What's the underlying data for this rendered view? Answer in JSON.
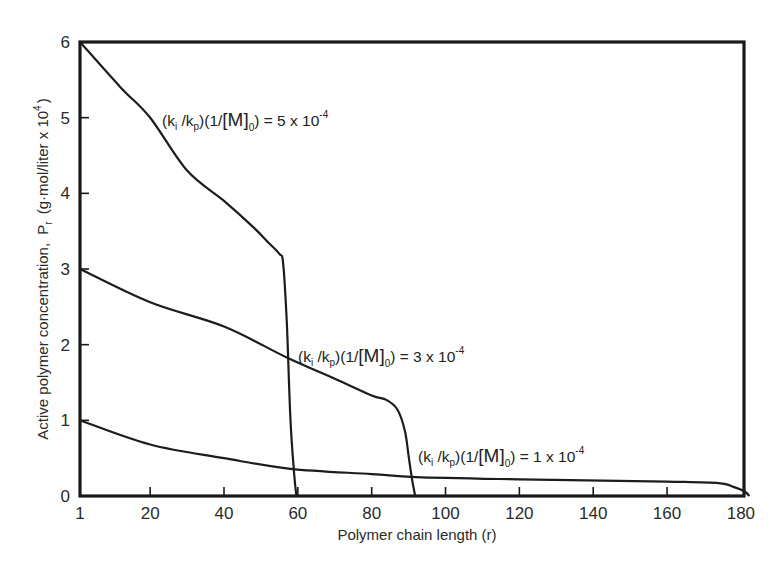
{
  "chart_data": {
    "type": "line",
    "title": "",
    "xlabel": "Polymer chain length (r)",
    "ylabel": "Active polymer concentration, Pr (g·mol/liter x 10^4)",
    "ylabel_parts": {
      "prefix": "Active polymer concentration,",
      "symbol": "P",
      "symbol_sub": "r",
      "units": "(g·mol/liter x 10",
      "units_sup": "4",
      "units_close": ")"
    },
    "xlim": [
      1,
      183
    ],
    "ylim": [
      0,
      6
    ],
    "x_ticks": [
      1,
      20,
      40,
      60,
      80,
      100,
      120,
      140,
      160,
      180
    ],
    "x_tick_labels": [
      "1",
      "20",
      "40",
      "60",
      "80",
      "100",
      "120",
      "140",
      "160",
      "180"
    ],
    "y_ticks": [
      0,
      1,
      2,
      3,
      4,
      5,
      6
    ],
    "y_tick_labels": [
      "0",
      "1",
      "2",
      "3",
      "4",
      "5",
      "6"
    ],
    "grid": false,
    "legend": "none (curves labeled inline)",
    "series": [
      {
        "name": "(ki/kp)(1/[M]0) = 5 x 10^-4",
        "label": {
          "pre": "(k",
          "sub1": "i",
          "mid1": " /k",
          "sub2": "p",
          "mid2": ")(1/",
          "bracket": "[M]",
          "sub3": "0",
          "mid3": ") = 5 x 10",
          "sup": "-4"
        },
        "label_pos": {
          "x": 162,
          "y": 126
        },
        "x": [
          1,
          12,
          20,
          30,
          40,
          48,
          52,
          55,
          56,
          57,
          58,
          59,
          59.6
        ],
        "y": [
          6.0,
          5.4,
          5.0,
          4.3,
          3.9,
          3.55,
          3.35,
          3.2,
          3.08,
          2.3,
          1.0,
          0.3,
          0.0
        ]
      },
      {
        "name": "(ki/kp)(1/[M]0) = 3 x 10^-4",
        "label": {
          "pre": "(k",
          "sub1": "i",
          "mid1": " /k",
          "sub2": "p",
          "mid2": ")(1/",
          "bracket": "[M]",
          "sub3": "0",
          "mid3": ") = 3 x 10",
          "sup": "-4"
        },
        "label_pos": {
          "x": 298,
          "y": 362
        },
        "x": [
          1,
          20,
          40,
          57,
          70,
          80,
          84,
          87,
          89,
          90,
          91,
          91.8
        ],
        "y": [
          3.0,
          2.56,
          2.24,
          1.83,
          1.55,
          1.33,
          1.27,
          1.14,
          0.86,
          0.53,
          0.2,
          0.0
        ],
        "intersects_series1_at": {
          "r": 57.5,
          "Pr": 1.62
        }
      },
      {
        "name": "(ki/kp)(1/[M]0) = 1 x 10^-4",
        "label": {
          "pre": "(k",
          "sub1": "i",
          "mid1": " /k",
          "sub2": "p",
          "mid2": ")(1/",
          "bracket": "[M]",
          "sub3": "0",
          "mid3": ") = 1 x 10",
          "sup": "-4"
        },
        "label_pos": {
          "x": 418,
          "y": 462
        },
        "x": [
          1,
          20,
          40,
          58,
          80,
          92,
          120,
          160,
          174,
          178,
          181,
          182.3
        ],
        "y": [
          1.0,
          0.68,
          0.5,
          0.36,
          0.29,
          0.25,
          0.22,
          0.19,
          0.17,
          0.12,
          0.06,
          0.0
        ]
      }
    ]
  }
}
